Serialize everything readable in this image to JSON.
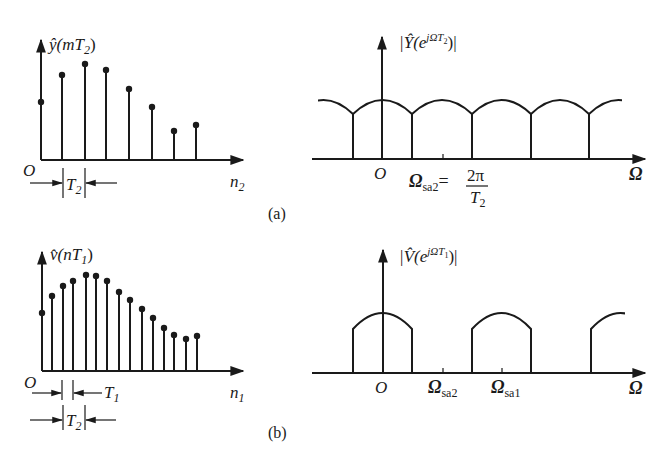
{
  "figure": {
    "caption_a": "(a)",
    "caption_b": "(b)"
  },
  "panel_a_time": {
    "ylabel_hat": "ŷ",
    "ylabel_arg": "(mT",
    "ylabel_sub": "2",
    "ylabel_close": ")",
    "origin": "O",
    "xlabel": "n",
    "xlabel_sub": "2",
    "period_label": "T",
    "period_sub": "2"
  },
  "panel_a_freq": {
    "ylabel_pre": "|Ŷ(e",
    "ylabel_sup": "jΩT",
    "ylabel_supsub": "2",
    "ylabel_post": ")|",
    "origin": "O",
    "xlabel": "Ω",
    "marker_label": "Ω",
    "marker_sub": "sa2",
    "marker_eq": "=",
    "marker_num": "2π",
    "marker_den": "T",
    "marker_den_sub": "2"
  },
  "panel_b_time": {
    "ylabel_hat": "v̂",
    "ylabel_arg": "(nT",
    "ylabel_sub": "1",
    "ylabel_close": ")",
    "origin": "O",
    "xlabel": "n",
    "xlabel_sub": "1",
    "period1_label": "T",
    "period1_sub": "1",
    "period2_label": "T",
    "period2_sub": "2"
  },
  "panel_b_freq": {
    "ylabel_pre": "|V̂(e",
    "ylabel_sup": "jΩT",
    "ylabel_supsub": "1",
    "ylabel_post": ")|",
    "origin": "O",
    "xlabel": "Ω",
    "marker1_label": "Ω",
    "marker1_sub": "sa2",
    "marker2_label": "Ω",
    "marker2_sub": "sa1"
  },
  "chart_data": [
    {
      "type": "stem",
      "title": "ŷ(mT2)",
      "xlabel": "n2",
      "baseline_y": 160,
      "x": [
        41,
        62,
        85,
        106,
        129,
        152,
        174,
        196
      ],
      "top_y": [
        102,
        75,
        64,
        70,
        89,
        107,
        131,
        125
      ]
    },
    {
      "type": "periodic-spectrum",
      "title": "|Ŷ(e^{jΩT2})|",
      "xlabel": "Ω",
      "description": "Overlapping (aliased) periodic spectrum with period Ωsa2 = 2π/T2",
      "boundaries_x": [
        353,
        412,
        472,
        531,
        589
      ],
      "peak_y": 100,
      "valley_y": 114,
      "baseline_y": 159
    },
    {
      "type": "stem",
      "title": "v̂(nT1)",
      "xlabel": "n1",
      "baseline_y": 371,
      "x": [
        42,
        52,
        63,
        73,
        86,
        96,
        107,
        119,
        130,
        142,
        153,
        164,
        174,
        186,
        197
      ],
      "top_y": [
        313,
        296,
        286,
        281,
        275,
        276,
        281,
        292,
        300,
        309,
        318,
        328,
        335,
        339,
        336
      ]
    },
    {
      "type": "periodic-spectrum",
      "title": "|V̂(e^{jΩT1})|",
      "xlabel": "Ω",
      "description": "Non-overlapping periodic spectrum with period Ωsa1; Ωsa2 marked",
      "lobes": [
        [
          353,
          412
        ],
        [
          472,
          532
        ],
        [
          591,
          625
        ]
      ],
      "peak_y": 313,
      "edge_y": 329,
      "baseline_y": 373
    }
  ]
}
